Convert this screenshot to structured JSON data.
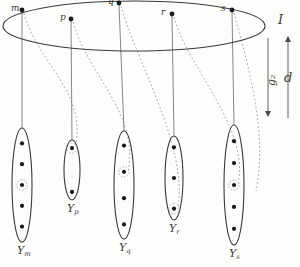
{
  "figure": {
    "type": "mathematical-diagram",
    "background_color": "#fdfdfc",
    "ink_color": "#3a3a3a",
    "dot_color": "#1a1a1a",
    "dashed_color": "#9a9a9a"
  },
  "labels": {
    "index_set": "I",
    "distance": "d",
    "map": "g₂"
  },
  "index_points": [
    {
      "id": "m",
      "label": "m",
      "x": 22,
      "y": 10
    },
    {
      "id": "p",
      "label": "p",
      "x": 71,
      "y": 19
    },
    {
      "id": "q",
      "label": "q",
      "x": 119,
      "y": 3
    },
    {
      "id": "r",
      "label": "r",
      "x": 172,
      "y": 14
    },
    {
      "id": "s",
      "label": "s",
      "x": 232,
      "y": 10
    }
  ],
  "top_ellipse": {
    "cx": 134,
    "cy": 26,
    "rx": 131,
    "ry": 25
  },
  "fibers": [
    {
      "id": "Y_m",
      "label": "Y",
      "subscript": "m",
      "cx": 22,
      "cy": 185,
      "rx": 10,
      "ry": 57,
      "dots": 5,
      "circled_index": 2
    },
    {
      "id": "Y_p",
      "label": "Y",
      "subscript": "p",
      "cx": 72,
      "cy": 170,
      "rx": 8,
      "ry": 30,
      "dots": 2,
      "circled_index": 0
    },
    {
      "id": "Y_q",
      "label": "Y",
      "subscript": "q",
      "cx": 124,
      "cy": 185,
      "rx": 10,
      "ry": 54,
      "dots": 4,
      "circled_index": 1
    },
    {
      "id": "Y_r",
      "label": "Y",
      "subscript": "r",
      "cx": 174,
      "cy": 178,
      "rx": 9,
      "ry": 42,
      "dots": 3,
      "circled_index": 2
    },
    {
      "id": "Y_s",
      "label": "Y",
      "subscript": "s",
      "cx": 234,
      "cy": 185,
      "rx": 10,
      "ry": 60,
      "dots": 5,
      "circled_index": 2
    }
  ],
  "arrows": {
    "g2": {
      "x": 268,
      "y_top": 38,
      "y_bottom": 116,
      "direction": "down"
    },
    "d": {
      "x": 288,
      "y_top": 37,
      "y_bottom": 118,
      "direction": "up"
    }
  }
}
